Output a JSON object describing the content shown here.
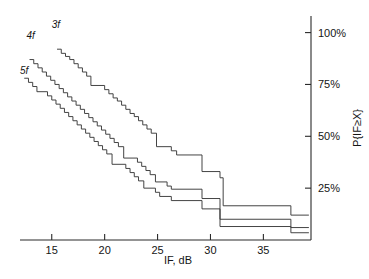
{
  "chart_data": {
    "type": "line",
    "title": "",
    "subtitle": "",
    "xlabel": "IF, dB",
    "ylabel": "P{IF≥X}",
    "xlim": [
      12,
      39.5
    ],
    "ylim": [
      0,
      108
    ],
    "grid": false,
    "legend_position": "inline-curve-labels",
    "xticks": [
      15,
      20,
      25,
      30,
      35
    ],
    "xtick_labels": [
      "15",
      "20",
      "25",
      "30",
      "35"
    ],
    "yticks": [
      25,
      50,
      75,
      100
    ],
    "ytick_labels": [
      "25%",
      "50%",
      "75%",
      "100%"
    ],
    "y_axis_side": "right",
    "x_axis_side": "bottom",
    "series": [
      {
        "name": "3f",
        "label": "3f",
        "label_x": 15.4,
        "label_y": 102,
        "points": [
          [
            15.5,
            92
          ],
          [
            15.9,
            92
          ],
          [
            15.9,
            90
          ],
          [
            16.3,
            90
          ],
          [
            16.3,
            88.5
          ],
          [
            16.7,
            88.5
          ],
          [
            16.7,
            87
          ],
          [
            17.1,
            87
          ],
          [
            17.1,
            85
          ],
          [
            17.5,
            85
          ],
          [
            17.5,
            83
          ],
          [
            17.9,
            83
          ],
          [
            17.9,
            81
          ],
          [
            18.3,
            81
          ],
          [
            18.3,
            79
          ],
          [
            18.7,
            79
          ],
          [
            18.7,
            74.5
          ],
          [
            20.0,
            74.5
          ],
          [
            20.0,
            72.5
          ],
          [
            20.4,
            72.5
          ],
          [
            20.4,
            70.5
          ],
          [
            20.8,
            70.5
          ],
          [
            20.8,
            68.5
          ],
          [
            21.2,
            68.5
          ],
          [
            21.2,
            67
          ],
          [
            21.6,
            67
          ],
          [
            21.6,
            65
          ],
          [
            22.0,
            65
          ],
          [
            22.0,
            63
          ],
          [
            22.4,
            63
          ],
          [
            22.4,
            61
          ],
          [
            22.8,
            61
          ],
          [
            22.8,
            59.5
          ],
          [
            23.2,
            59.5
          ],
          [
            23.2,
            57.5
          ],
          [
            23.6,
            57.5
          ],
          [
            23.6,
            55.5
          ],
          [
            24.0,
            55.5
          ],
          [
            24.0,
            53.5
          ],
          [
            24.4,
            53.5
          ],
          [
            24.4,
            51.5
          ],
          [
            24.9,
            51.5
          ],
          [
            24.9,
            45
          ],
          [
            26.3,
            45
          ],
          [
            26.3,
            43
          ],
          [
            26.8,
            43
          ],
          [
            26.8,
            41
          ],
          [
            29.2,
            41
          ],
          [
            29.2,
            33
          ],
          [
            30.9,
            33
          ],
          [
            30.9,
            30
          ],
          [
            31.2,
            30
          ],
          [
            31.2,
            16.5
          ],
          [
            37.6,
            16.5
          ],
          [
            37.6,
            12
          ],
          [
            39.3,
            12
          ]
        ]
      },
      {
        "name": "4f",
        "label": "4f",
        "label_x": 13.0,
        "label_y": 97,
        "points": [
          [
            12.9,
            87
          ],
          [
            13.3,
            87
          ],
          [
            13.3,
            85
          ],
          [
            13.7,
            85
          ],
          [
            13.7,
            83
          ],
          [
            14.1,
            83
          ],
          [
            14.1,
            81
          ],
          [
            14.5,
            81
          ],
          [
            14.5,
            79
          ],
          [
            14.9,
            79
          ],
          [
            14.9,
            77
          ],
          [
            15.3,
            77
          ],
          [
            15.3,
            75
          ],
          [
            15.7,
            75
          ],
          [
            15.7,
            73
          ],
          [
            16.1,
            73
          ],
          [
            16.1,
            71
          ],
          [
            16.5,
            71
          ],
          [
            16.5,
            69
          ],
          [
            16.9,
            69
          ],
          [
            16.9,
            67
          ],
          [
            17.3,
            67
          ],
          [
            17.3,
            65
          ],
          [
            17.7,
            65
          ],
          [
            17.7,
            63
          ],
          [
            18.1,
            63
          ],
          [
            18.1,
            61
          ],
          [
            18.5,
            61
          ],
          [
            18.5,
            59
          ],
          [
            18.9,
            59
          ],
          [
            18.9,
            57
          ],
          [
            19.3,
            57
          ],
          [
            19.3,
            55
          ],
          [
            19.7,
            55
          ],
          [
            19.7,
            53
          ],
          [
            20.1,
            53
          ],
          [
            20.1,
            51
          ],
          [
            20.5,
            51
          ],
          [
            20.5,
            49
          ],
          [
            20.9,
            49
          ],
          [
            20.9,
            47
          ],
          [
            21.3,
            47
          ],
          [
            21.3,
            45
          ],
          [
            21.8,
            45
          ],
          [
            21.8,
            39.5
          ],
          [
            23.1,
            39.5
          ],
          [
            23.1,
            37.5
          ],
          [
            23.5,
            37.5
          ],
          [
            23.5,
            35.5
          ],
          [
            23.9,
            35.5
          ],
          [
            23.9,
            33.5
          ],
          [
            24.3,
            33.5
          ],
          [
            24.3,
            31.5
          ],
          [
            24.8,
            31.5
          ],
          [
            24.8,
            28
          ],
          [
            25.9,
            28
          ],
          [
            25.9,
            26
          ],
          [
            26.3,
            26
          ],
          [
            26.3,
            24.5
          ],
          [
            29.2,
            24.5
          ],
          [
            29.2,
            20
          ],
          [
            30.9,
            20
          ],
          [
            30.9,
            10
          ],
          [
            37.6,
            10
          ],
          [
            37.6,
            6
          ],
          [
            39.3,
            6
          ]
        ]
      },
      {
        "name": "5f",
        "label": "5f",
        "label_x": 12.4,
        "label_y": 80,
        "points": [
          [
            12.4,
            78
          ],
          [
            12.8,
            78
          ],
          [
            12.8,
            76
          ],
          [
            13.2,
            76
          ],
          [
            13.2,
            74
          ],
          [
            13.6,
            74
          ],
          [
            13.6,
            71.5
          ],
          [
            14.6,
            71.5
          ],
          [
            14.6,
            69.5
          ],
          [
            15.0,
            69.5
          ],
          [
            15.0,
            67.5
          ],
          [
            15.4,
            67.5
          ],
          [
            15.4,
            65.5
          ],
          [
            15.8,
            65.5
          ],
          [
            15.8,
            63.5
          ],
          [
            16.2,
            63.5
          ],
          [
            16.2,
            61.5
          ],
          [
            16.6,
            61.5
          ],
          [
            16.6,
            59.5
          ],
          [
            17.0,
            59.5
          ],
          [
            17.0,
            57.5
          ],
          [
            17.4,
            57.5
          ],
          [
            17.4,
            55.5
          ],
          [
            17.8,
            55.5
          ],
          [
            17.8,
            53.5
          ],
          [
            18.2,
            53.5
          ],
          [
            18.2,
            51.5
          ],
          [
            18.6,
            51.5
          ],
          [
            18.6,
            49.5
          ],
          [
            19.0,
            49.5
          ],
          [
            19.0,
            47.5
          ],
          [
            19.4,
            47.5
          ],
          [
            19.4,
            45.5
          ],
          [
            19.8,
            45.5
          ],
          [
            19.8,
            43.5
          ],
          [
            20.2,
            43.5
          ],
          [
            20.2,
            41.5
          ],
          [
            20.7,
            41.5
          ],
          [
            20.7,
            36.5
          ],
          [
            22.0,
            36.5
          ],
          [
            22.0,
            34.5
          ],
          [
            22.4,
            34.5
          ],
          [
            22.4,
            32.5
          ],
          [
            22.8,
            32.5
          ],
          [
            22.8,
            30.5
          ],
          [
            23.2,
            30.5
          ],
          [
            23.2,
            28.5
          ],
          [
            23.7,
            28.5
          ],
          [
            23.7,
            25
          ],
          [
            24.8,
            25
          ],
          [
            24.8,
            23
          ],
          [
            25.2,
            23
          ],
          [
            25.2,
            21
          ],
          [
            26.3,
            21
          ],
          [
            26.3,
            19
          ],
          [
            29.2,
            19
          ],
          [
            29.2,
            15
          ],
          [
            30.9,
            15
          ],
          [
            30.9,
            6.5
          ],
          [
            37.6,
            6.5
          ],
          [
            37.6,
            3.5
          ],
          [
            39.3,
            3.5
          ]
        ]
      }
    ]
  }
}
